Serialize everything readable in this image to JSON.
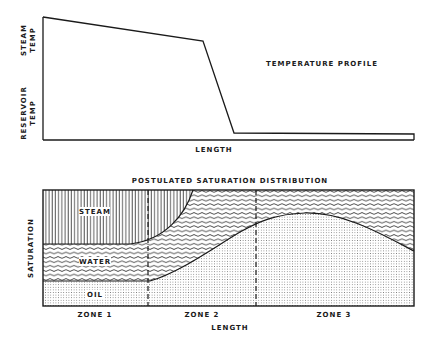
{
  "top_chart": {
    "title": "TEMPERATURE PROFILE",
    "y_label_high_line1": "STEAM",
    "y_label_high_line2": "TEMP",
    "y_label_low_line1": "RESERVOIR",
    "y_label_low_line2": "TEMP",
    "x_label": "LENGTH"
  },
  "bottom_chart": {
    "title": "POSTULATED SATURATION DISTRIBUTION",
    "y_label": "SATURATION",
    "x_label": "LENGTH",
    "phases": [
      {
        "name": "STEAM",
        "pattern": "vertical-lines"
      },
      {
        "name": "WATER",
        "pattern": "wavy-lines"
      },
      {
        "name": "OIL",
        "pattern": "dots"
      }
    ],
    "zones": [
      "ZONE 1",
      "ZONE 2",
      "ZONE 3"
    ]
  },
  "colors": {
    "ink": "#1a1a1a",
    "background": "#ffffff"
  }
}
